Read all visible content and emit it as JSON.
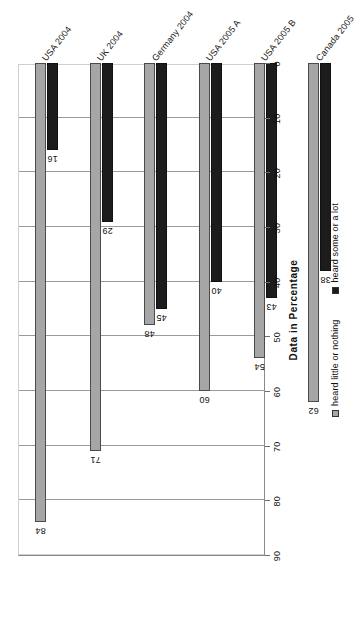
{
  "chart_data": {
    "type": "bar",
    "title": "",
    "xlabel": "",
    "ylabel": "Data in Percentage",
    "ylim": [
      0,
      90
    ],
    "ytick_step": 10,
    "yticks": [
      0,
      10,
      20,
      30,
      40,
      50,
      60,
      70,
      80,
      90
    ],
    "grid": true,
    "orientation": "vertical-grouped",
    "rotated_view": "figure rendered rotated 90 degrees counter-clockwise",
    "legend_position": "bottom",
    "categories": [
      "USA 2004",
      "UK 2004",
      "Germany 2004",
      "USA 2005 A",
      "USA 2005 B",
      "Canada 2005",
      "USA 2006",
      "USA 2007",
      "Germany 2008"
    ],
    "series": [
      {
        "name": "heard little or nothing",
        "color": "#a6a6a6",
        "values": [
          84,
          71,
          48,
          60,
          54,
          62,
          69,
          81,
          48
        ]
      },
      {
        "name": "heard some or a lot",
        "color": "#1c1c1c",
        "values": [
          16,
          29,
          45,
          40,
          43,
          38,
          30,
          19,
          52
        ]
      }
    ]
  },
  "axis": {
    "value_axis_title": "Data in Percentage"
  },
  "legend": {
    "items": [
      {
        "label": "heard little or nothing",
        "color": "#a6a6a6"
      },
      {
        "label": "heard some or a lot",
        "color": "#1c1c1c"
      }
    ]
  },
  "colors": {
    "series_light": "#a6a6a6",
    "series_dark": "#1c1c1c",
    "grid": "#9a9a9a",
    "axis": "#8b8b8b",
    "text": "#111111",
    "background": "#ffffff"
  }
}
